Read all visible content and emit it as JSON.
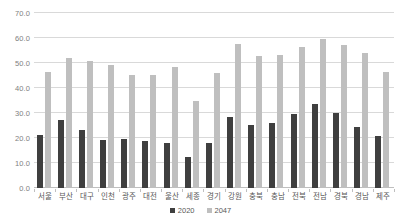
{
  "chart_data": {
    "type": "bar",
    "title": "",
    "subtitle": "",
    "xlabel": "",
    "ylabel": "",
    "ylim": [
      0.0,
      70.0
    ],
    "y_tick_step": 10.0,
    "y_tick_labels": [
      "0.0",
      "10.0",
      "20.0",
      "30.0",
      "40.0",
      "50.0",
      "60.0",
      "70.0"
    ],
    "y_tick_values": [
      0.0,
      10.0,
      20.0,
      30.0,
      40.0,
      50.0,
      60.0,
      70.0
    ],
    "grid": true,
    "legend_position": "bottom-center",
    "categories": [
      "서울",
      "부산",
      "대구",
      "인천",
      "광주",
      "대전",
      "울산",
      "세종",
      "경기",
      "강원",
      "충북",
      "충남",
      "전북",
      "전남",
      "경북",
      "경남",
      "제주"
    ],
    "series": [
      {
        "name": "2020",
        "color": "#3f3f3f",
        "values": [
          21.2,
          27.1,
          23.4,
          19.2,
          19.5,
          19.0,
          18.0,
          12.5,
          17.9,
          28.6,
          25.1,
          26.1,
          29.7,
          33.6,
          30.0,
          24.6,
          21.0
        ]
      },
      {
        "name": "2047",
        "color": "#bfbfbf",
        "values": [
          46.3,
          52.1,
          51.0,
          49.4,
          45.2,
          45.4,
          48.6,
          34.8,
          45.9,
          57.5,
          52.7,
          53.3,
          56.4,
          59.8,
          57.3,
          54.2,
          46.5
        ]
      }
    ]
  },
  "legend": {
    "items": [
      {
        "label": "2020",
        "color": "#3f3f3f"
      },
      {
        "label": "2047",
        "color": "#bfbfbf"
      }
    ]
  }
}
